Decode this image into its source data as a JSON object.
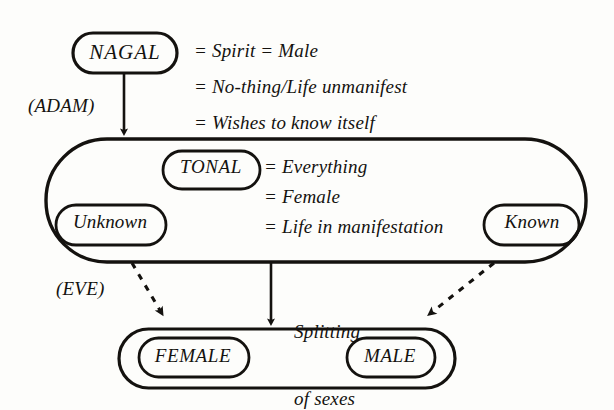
{
  "diagram": {
    "background_color": "#fdfdfb",
    "ink_color": "#14120f",
    "nodes": {
      "nagal": {
        "label": "NAGAL",
        "shape": "rounded-oval"
      },
      "tonal": {
        "label": "TONAL",
        "shape": "rounded-oval"
      },
      "unknown": {
        "label": "Unknown",
        "shape": "rounded-oval"
      },
      "known": {
        "label": "Known",
        "shape": "rounded-oval"
      },
      "female": {
        "label": "FEMALE",
        "shape": "rounded-oval"
      },
      "male": {
        "label": "MALE",
        "shape": "rounded-oval"
      },
      "tonal_container": {
        "label": "",
        "shape": "stadium"
      },
      "sexes_container": {
        "label": "",
        "shape": "stadium"
      }
    },
    "nagal_attributes": [
      "= Spirit = Male",
      "= No-thing/Life unmanifest",
      "= Wishes to know itself"
    ],
    "tonal_attributes": [
      "= Everything",
      "= Female",
      "= Life in manifestation"
    ],
    "edge_labels": {
      "adam": "(ADAM)",
      "eve": "(EVE)",
      "splitting_line1": "Splitting",
      "splitting_line2": "of sexes"
    },
    "arrows": [
      {
        "name": "nagal-to-tonal",
        "style": "solid",
        "from": "nagal",
        "to": "tonal_container"
      },
      {
        "name": "tonal-to-sexes",
        "style": "solid",
        "from": "tonal_container",
        "to": "sexes_container"
      },
      {
        "name": "unknown-to-female",
        "style": "dashed",
        "from": "unknown",
        "to": "female"
      },
      {
        "name": "known-to-male",
        "style": "dashed",
        "from": "known",
        "to": "male"
      }
    ]
  }
}
